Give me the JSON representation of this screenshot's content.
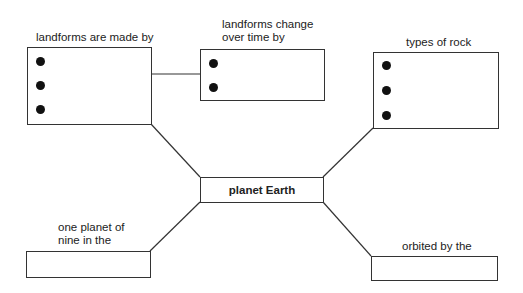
{
  "diagram": {
    "type": "concept-map",
    "center": {
      "label": "planet Earth"
    },
    "nodes": [
      {
        "id": "made-by",
        "label": "landforms are made by",
        "bullets": 3
      },
      {
        "id": "change-by",
        "label_line1": "landforms change",
        "label_line2": "over time by",
        "bullets": 2
      },
      {
        "id": "rock-types",
        "label": "types of rock",
        "bullets": 3
      },
      {
        "id": "one-planet",
        "label_line1": "one planet of",
        "label_line2": "nine in the",
        "bullets": 0
      },
      {
        "id": "orbited-by",
        "label": "orbited by the",
        "bullets": 0
      }
    ],
    "edges": [
      [
        "made-by",
        "change-by"
      ],
      [
        "made-by",
        "center"
      ],
      [
        "rock-types",
        "center"
      ],
      [
        "center",
        "one-planet"
      ],
      [
        "center",
        "orbited-by"
      ]
    ],
    "colors": {
      "line": "#333333",
      "bullet": "#111111",
      "background": "#ffffff"
    }
  }
}
